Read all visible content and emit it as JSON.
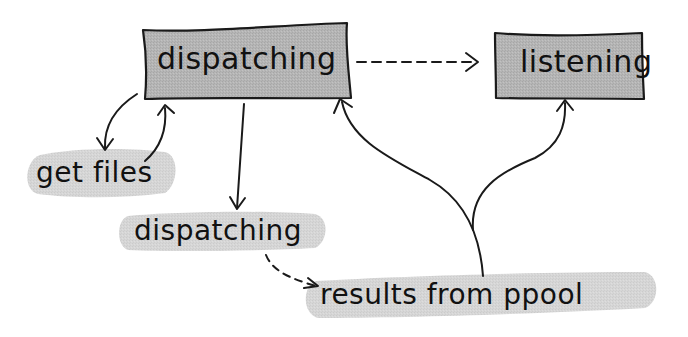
{
  "diagram": {
    "type": "state-flow",
    "colors": {
      "box_fill": "#b3b3b3",
      "blob_fill": "#d4d4d4",
      "stroke": "#1a1a1a",
      "background": "#ffffff"
    },
    "nodes": {
      "dispatching_state": {
        "label": "dispatching",
        "shape": "box"
      },
      "listening_state": {
        "label": "listening",
        "shape": "box"
      },
      "get_files": {
        "label": "get files",
        "shape": "blob"
      },
      "dispatching_event": {
        "label": "dispatching",
        "shape": "blob"
      },
      "results_from_ppool": {
        "label": "results from ppool",
        "shape": "blob"
      }
    },
    "edges": [
      {
        "from": "dispatching_state",
        "to": "listening_state",
        "style": "dashed"
      },
      {
        "from": "dispatching_state",
        "to": "get_files",
        "style": "solid"
      },
      {
        "from": "get_files",
        "to": "dispatching_state",
        "style": "solid"
      },
      {
        "from": "dispatching_state",
        "to": "dispatching_event",
        "style": "solid"
      },
      {
        "from": "dispatching_event",
        "to": "results_from_ppool",
        "style": "dashed"
      },
      {
        "from": "results_from_ppool",
        "to": "dispatching_state",
        "style": "solid"
      },
      {
        "from": "results_from_ppool",
        "to": "listening_state",
        "style": "solid"
      }
    ]
  }
}
